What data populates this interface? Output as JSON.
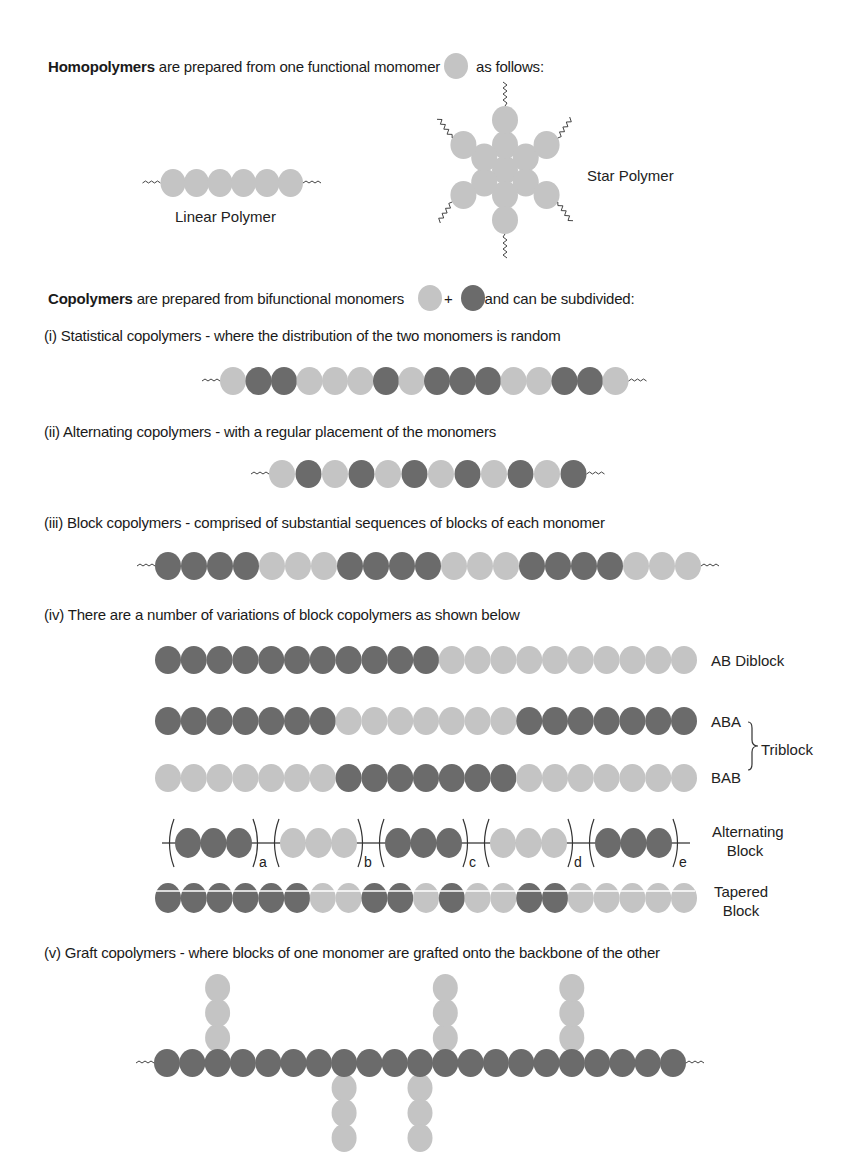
{
  "colors": {
    "light": "#c4c4c4",
    "dark": "#6b6b6b",
    "line": "#555555",
    "text": "#1a1a1a"
  },
  "homopolymers": {
    "intro_bold": "Homopolymers",
    "intro_rest": " are prepared from one functional momomer",
    "intro_end": " as follows:",
    "linear_label": "Linear Polymer",
    "star_label": "Star Polymer",
    "linear_sequence": "LLLLLL"
  },
  "copolymers": {
    "intro_bold": "Copolymers",
    "intro_rest": " are prepared from bifunctional monomers",
    "plus": "+",
    "intro_end": "and can be subdivided:",
    "statistical": {
      "caption": "(i) Statistical copolymers - where the distribution of the two monomers is random",
      "sequence": "LDDLLLDLDDDLLDDL"
    },
    "alternating": {
      "caption": "(ii) Alternating copolymers - with a regular placement of the monomers",
      "sequence": "LDLDLDLDLDLD"
    },
    "block": {
      "caption": "(iii) Block copolymers - comprised of substantial sequences of blocks of each monomer",
      "sequence": "DDDDLLLDDDDLLLDDDDLLL"
    },
    "variations": {
      "caption": "(iv) There are a number of variations of block copolymers as shown below",
      "rows": [
        {
          "name": "ab-diblock",
          "label": "AB Diblock",
          "sequence": "DDDDDDDDDDDLLLLLLLLLL"
        },
        {
          "name": "aba-triblock",
          "label": "ABA",
          "sequence": "DDDDDDDLLLLLLLDDDDDDD"
        },
        {
          "name": "bab-triblock",
          "label": "BAB",
          "sequence": "LLLLLLLDDDDDDDLLLLLLL"
        },
        {
          "name": "tapered-block",
          "label_line1": "Tapered",
          "label_line2": "Block",
          "sequence": "DDDDDDLLDDLDLLDDLLLLL"
        }
      ],
      "triblock_label": "Triblock",
      "alternating_block": {
        "label_line1": "Alternating",
        "label_line2": "Block",
        "groups": [
          {
            "sequence": "DDD",
            "subscript": "a"
          },
          {
            "sequence": "LLL",
            "subscript": "b"
          },
          {
            "sequence": "DDD",
            "subscript": "c"
          },
          {
            "sequence": "LLL",
            "subscript": "d"
          },
          {
            "sequence": "DDD",
            "subscript": "e"
          }
        ]
      }
    },
    "graft": {
      "caption": "(v) Graft copolymers - where blocks of one monomer are grafted onto the backbone of the other",
      "backbone_sequence": "DDDDDDDDDDDDDDDDDDDDD",
      "grafts_above": [
        2,
        11,
        16
      ],
      "grafts_below": [
        7,
        10
      ],
      "graft_length": 3
    }
  }
}
